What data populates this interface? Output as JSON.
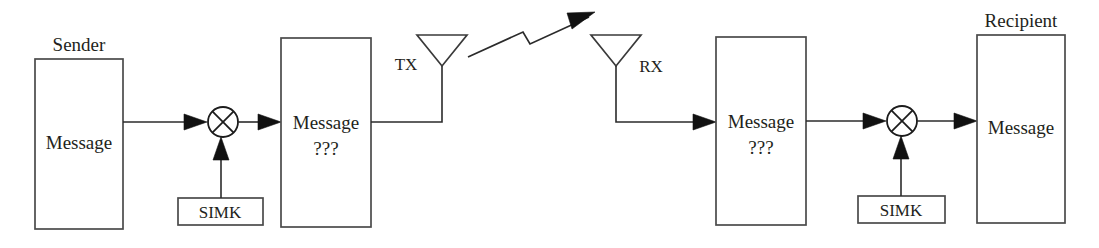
{
  "diagram": {
    "type": "block-diagram",
    "background_color": "#ffffff",
    "line_color": "#2b2b2b",
    "text_color": "#231f20",
    "sender": {
      "caption": "Sender",
      "box_label": "Message"
    },
    "sender_mixer": {
      "symbol": "circle-with-x",
      "name": "modulator-mixer"
    },
    "sender_key": {
      "label": "SIMK"
    },
    "encoded_tx_block": {
      "line1": "Message",
      "line2": "???"
    },
    "tx_antenna": {
      "label": "TX"
    },
    "radio_link": {
      "symbol": "lightning-bolt-arrow",
      "direction": "left-to-right"
    },
    "rx_antenna": {
      "label": "RX"
    },
    "encoded_rx_block": {
      "line1": "Message",
      "line2": "???"
    },
    "recipient_mixer": {
      "symbol": "circle-with-x",
      "name": "demodulator-mixer"
    },
    "recipient_key": {
      "label": "SIMK"
    },
    "recipient": {
      "caption": "Recipient",
      "box_label": "Message"
    }
  }
}
